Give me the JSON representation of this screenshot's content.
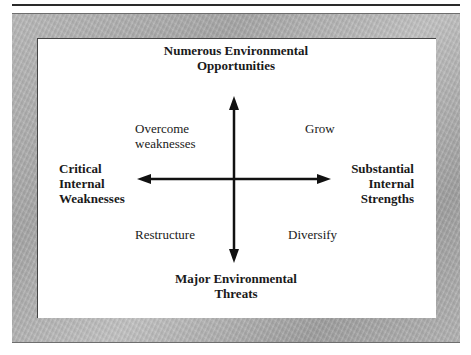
{
  "diagram": {
    "axes": {
      "top": {
        "line1": "Numerous Environmental",
        "line2": "Opportunities"
      },
      "bottom": {
        "line1": "Major Environmental",
        "line2": "Threats"
      },
      "left": {
        "line1": "Critical",
        "line2": "Internal",
        "line3": "Weaknesses"
      },
      "right": {
        "line1": "Substantial",
        "line2": "Internal",
        "line3": "Strengths"
      }
    },
    "quadrants": {
      "top_left": {
        "line1": "Overcome",
        "line2": "weaknesses"
      },
      "top_right": {
        "line1": "Grow"
      },
      "bottom_left": {
        "line1": "Restructure"
      },
      "bottom_right": {
        "line1": "Diversify"
      }
    },
    "colors": {
      "frame": "#b0b0b0",
      "panel": "#ffffff",
      "ink": "#1a1a1a"
    }
  }
}
